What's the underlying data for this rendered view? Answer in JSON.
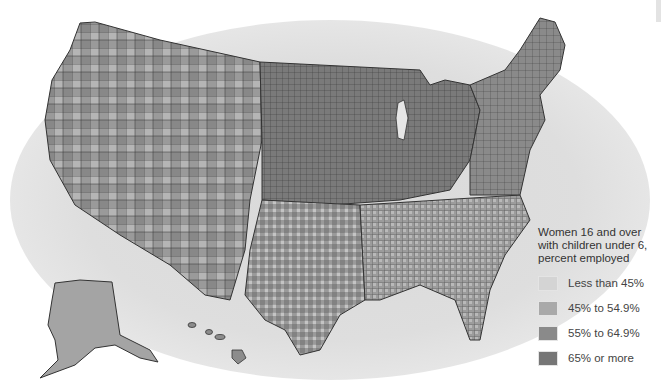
{
  "map": {
    "subject": "United States counties",
    "style": "grayscale choropleth",
    "background_halo_color": "#dcdcdc",
    "county_border_color": "#333333"
  },
  "legend": {
    "title_lines": [
      "Women 16 and over",
      "with children under 6,",
      "percent employed"
    ],
    "items": [
      {
        "label": "Less than 45%",
        "color": "#d4d4d4"
      },
      {
        "label": "45% to 54.9%",
        "color": "#a9a9a9"
      },
      {
        "label": "55% to 64.9%",
        "color": "#8a8a8a"
      },
      {
        "label": "65% or more",
        "color": "#767676"
      }
    ]
  },
  "insets": [
    "Alaska",
    "Hawaii"
  ]
}
